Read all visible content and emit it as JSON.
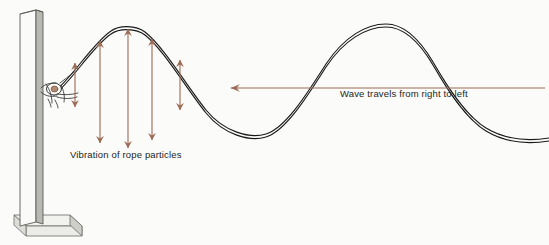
{
  "diagram": {
    "background_color": "#fbfbf9",
    "labels": {
      "vibration": "Vibration of rope particles",
      "wave_direction": "Wave travels from right to left"
    },
    "colors": {
      "rope_line": "#1a1a1a",
      "arrow": "#9c6b55",
      "post_face": "#f4f4f2",
      "post_shadow": "#b9b9b4",
      "post_outline": "#5a5a58",
      "text": "#221f1d"
    },
    "post": {
      "name": "vertical-post",
      "x": 20,
      "top": 10,
      "bottom": 222,
      "width": 22
    },
    "knot": {
      "name": "rope-knot",
      "x": 54,
      "y": 89
    },
    "wave": {
      "type": "transverse",
      "crest_1": {
        "x": 127,
        "y": 26
      },
      "trough_1": {
        "x": 265,
        "y": 134
      },
      "crest_2": {
        "x": 400,
        "y": 25
      },
      "start": {
        "x": 54,
        "y": 92
      },
      "end": {
        "x": 549,
        "y": 140
      },
      "double_line_offset": 3
    },
    "vibration_arrows": [
      {
        "name": "vibration-arrow-1",
        "x": 75,
        "top": 63,
        "bottom": 107
      },
      {
        "name": "vibration-arrow-2",
        "x": 100,
        "top": 41,
        "bottom": 143
      },
      {
        "name": "vibration-arrow-3",
        "x": 128,
        "top": 29,
        "bottom": 148
      },
      {
        "name": "vibration-arrow-4",
        "x": 152,
        "top": 39,
        "bottom": 140
      },
      {
        "name": "vibration-arrow-5",
        "x": 180,
        "top": 60,
        "bottom": 110
      }
    ],
    "direction_arrow": {
      "name": "wave-direction-arrow",
      "y": 88,
      "tip_x": 230,
      "tail_x": 545
    }
  }
}
